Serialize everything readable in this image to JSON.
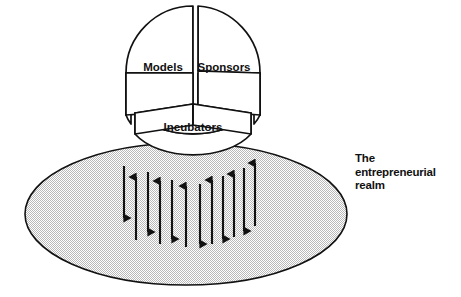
{
  "diagram": {
    "title_text": "The entrepreneurial realm",
    "realm_label_lines": [
      "The",
      "entrepreneurial",
      "realm"
    ],
    "background_color": "#ffffff",
    "stroke_color": "#111111",
    "fill_color": "#ffffff",
    "realm_fill_color": "#d9d9d9",
    "pie": {
      "center_x": 193,
      "center_y": 73,
      "radius": 67,
      "depth": 42,
      "wedges": [
        {
          "label": "Models",
          "start_deg": 180,
          "end_deg": 300,
          "exploded": false,
          "label_x": 163,
          "label_y": 68
        },
        {
          "label": "Sponsors",
          "start_deg": 300,
          "end_deg": 60,
          "exploded": false,
          "label_x": 224,
          "label_y": 68
        },
        {
          "label": "Incubators",
          "start_deg": 60,
          "end_deg": 180,
          "exploded": true,
          "label_x": 193,
          "label_y": 130
        }
      ]
    },
    "realm_ellipse": {
      "center_x": 186,
      "center_y": 214,
      "radius_x": 161,
      "radius_y": 71
    },
    "arrows": [
      {
        "x": 124,
        "direction": "down",
        "top": 166,
        "bottom": 218
      },
      {
        "x": 136,
        "direction": "up",
        "top": 177,
        "bottom": 240
      },
      {
        "x": 148,
        "direction": "down",
        "top": 172,
        "bottom": 232
      },
      {
        "x": 160,
        "direction": "up",
        "top": 181,
        "bottom": 244
      },
      {
        "x": 172,
        "direction": "down",
        "top": 180,
        "bottom": 239
      },
      {
        "x": 186,
        "direction": "up",
        "top": 186,
        "bottom": 247
      },
      {
        "x": 200,
        "direction": "down",
        "top": 184,
        "bottom": 244
      },
      {
        "x": 212,
        "direction": "up",
        "top": 180,
        "bottom": 244
      },
      {
        "x": 223,
        "direction": "down",
        "top": 176,
        "bottom": 239
      },
      {
        "x": 234,
        "direction": "up",
        "top": 174,
        "bottom": 237
      },
      {
        "x": 244,
        "direction": "down",
        "top": 168,
        "bottom": 231
      },
      {
        "x": 255,
        "direction": "up",
        "top": 163,
        "bottom": 226
      }
    ],
    "icons": {
      "realm_surface": "ellipse-shaded",
      "pie_chart": "three-wedge-3d-pie"
    }
  }
}
